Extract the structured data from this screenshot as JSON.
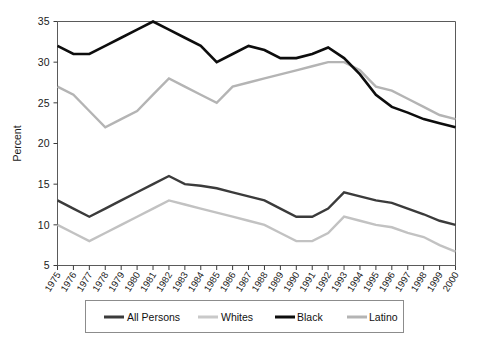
{
  "chart_data": {
    "type": "line",
    "title": "",
    "xlabel": "",
    "ylabel": "Percent",
    "grid": false,
    "legend_position": "bottom",
    "ylim": [
      5,
      35
    ],
    "yticks": [
      5,
      10,
      15,
      20,
      25,
      30,
      35
    ],
    "ytick_labels": [
      "5",
      "10",
      "15",
      "20",
      "25",
      "30",
      "35"
    ],
    "x": [
      1975,
      1976,
      1977,
      1978,
      1979,
      1980,
      1981,
      1982,
      1983,
      1984,
      1985,
      1986,
      1987,
      1988,
      1989,
      1990,
      1991,
      1992,
      1993,
      1994,
      1995,
      1996,
      1997,
      1998,
      1999,
      2000
    ],
    "xtick_labels": [
      "1975",
      "1976",
      "1977",
      "1978",
      "1979",
      "1980",
      "1981",
      "1982",
      "1983",
      "1984",
      "1985",
      "1986",
      "1987",
      "1988",
      "1989",
      "1990",
      "1991",
      "1992",
      "1993",
      "1994",
      "1995",
      "1996",
      "1997",
      "1998",
      "1999",
      "2000"
    ],
    "series": [
      {
        "name": "All Persons",
        "color": "#3b3b3b",
        "width": 2.4,
        "values": [
          13.0,
          12.0,
          11.0,
          12.0,
          13.0,
          14.0,
          15.0,
          16.0,
          15.0,
          14.8,
          14.5,
          14.0,
          13.5,
          13.0,
          12.0,
          11.0,
          11.0,
          12.0,
          14.0,
          13.5,
          13.0,
          12.7,
          12.0,
          11.3,
          10.5,
          10.0
        ]
      },
      {
        "name": "Whites",
        "color": "#c2c2c2",
        "width": 2.4,
        "values": [
          10.0,
          9.0,
          8.0,
          9.0,
          10.0,
          11.0,
          12.0,
          13.0,
          12.5,
          12.0,
          11.5,
          11.0,
          10.5,
          10.0,
          9.0,
          8.0,
          8.0,
          9.0,
          11.0,
          10.5,
          10.0,
          9.7,
          9.0,
          8.5,
          7.5,
          6.7
        ]
      },
      {
        "name": "Black",
        "color": "#0d0d0d",
        "width": 2.6,
        "values": [
          32.0,
          31.0,
          31.0,
          32.0,
          33.0,
          34.0,
          35.0,
          34.0,
          33.0,
          32.0,
          30.0,
          31.0,
          32.0,
          31.5,
          30.5,
          30.5,
          31.0,
          31.8,
          30.5,
          28.5,
          26.0,
          24.5,
          23.8,
          23.0,
          22.5,
          22.0
        ]
      },
      {
        "name": "Latino",
        "color": "#b4b4b4",
        "width": 2.4,
        "values": [
          27.0,
          26.0,
          24.0,
          22.0,
          23.0,
          24.0,
          26.0,
          28.0,
          27.0,
          26.0,
          25.0,
          27.0,
          27.5,
          28.0,
          28.5,
          29.0,
          29.5,
          30.0,
          30.0,
          29.0,
          27.0,
          26.5,
          25.5,
          24.5,
          23.5,
          23.0
        ]
      }
    ]
  },
  "axes": {
    "ylabel": "Percent"
  },
  "legend": {
    "entries": [
      {
        "label": "All Persons",
        "color": "#3b3b3b"
      },
      {
        "label": "Whites",
        "color": "#c9c9c9"
      },
      {
        "label": "Black",
        "color": "#0d0d0d"
      },
      {
        "label": "Latino",
        "color": "#b4b4b4"
      }
    ]
  }
}
